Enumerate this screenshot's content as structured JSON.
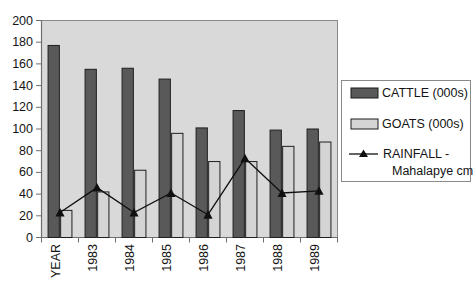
{
  "chart_data": {
    "type": "bar",
    "title": "",
    "subtitle": "",
    "xlabel": "",
    "ylabel": "",
    "ylim": [
      0,
      200
    ],
    "ytick_step": 20,
    "yticks": [
      "0",
      "20",
      "40",
      "60",
      "80",
      "100",
      "120",
      "140",
      "160",
      "180",
      "200"
    ],
    "grid": false,
    "legend_position": "right",
    "categories": [
      "YEAR",
      "1983",
      "1984",
      "1985",
      "1986",
      "1987",
      "1988",
      "1989"
    ],
    "series": [
      {
        "name": "CATTLE (000s)",
        "type": "bar",
        "color": "#595959",
        "values": [
          177,
          155,
          156,
          146,
          101,
          117,
          99,
          100
        ]
      },
      {
        "name": "GOATS (000s)",
        "type": "bar",
        "color": "#d4d4d4",
        "values": [
          25,
          42,
          62,
          96,
          70,
          70,
          84,
          88
        ]
      },
      {
        "name": "RAINFALL - Mahalapye cm",
        "type": "line",
        "color": "#101010",
        "marker": "triangle",
        "values": [
          23,
          46,
          23,
          41,
          21,
          73,
          41,
          43
        ]
      }
    ]
  },
  "legend": {
    "items": [
      {
        "label": "CATTLE (000s)",
        "swatch": "bar-dark",
        "color": "#595959"
      },
      {
        "label": "GOATS (000s)",
        "swatch": "bar-light",
        "color": "#d4d4d4"
      },
      {
        "label": "RAINFALL -",
        "label2": "Mahalapye cm",
        "swatch": "line-triangle",
        "color": "#101010"
      }
    ]
  },
  "plot": {
    "background": "#d9d9d9",
    "border_color": "#808080",
    "axis_color": "#707070"
  }
}
